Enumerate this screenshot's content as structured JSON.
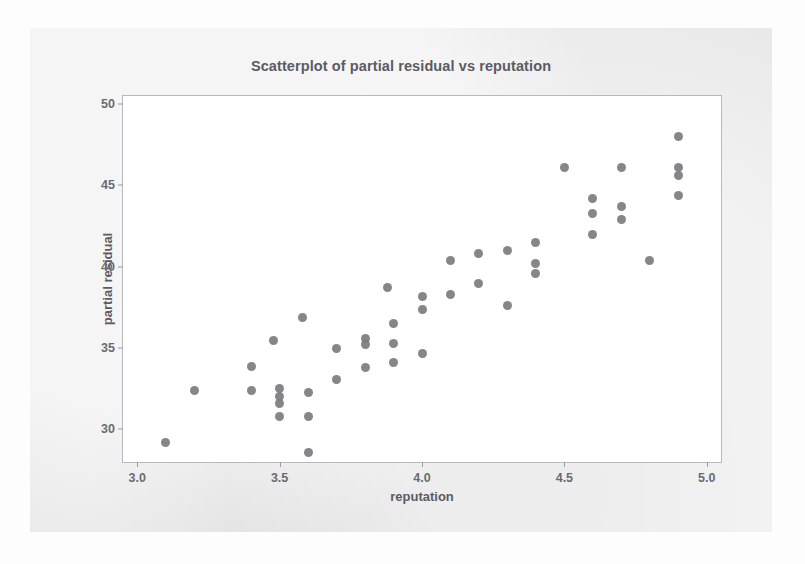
{
  "figure": {
    "background_color": "#e9e9e9",
    "plot_background_color": "#ffffff",
    "frame_color": "#b9b9bd",
    "point_color": "#7b7b80",
    "text_color": "#5b5b63"
  },
  "chart_data": {
    "type": "scatter",
    "title": "Scatterplot of partial residual vs reputation",
    "xlabel": "reputation",
    "ylabel": "partial residual",
    "xlim": [
      2.95,
      5.05
    ],
    "ylim": [
      28.0,
      50.5
    ],
    "xticks": [
      "3.0",
      "3.5",
      "4.0",
      "4.5",
      "5.0"
    ],
    "xtick_values": [
      3.0,
      3.5,
      4.0,
      4.5,
      5.0
    ],
    "yticks": [
      "30",
      "35",
      "40",
      "45",
      "50"
    ],
    "ytick_values": [
      30,
      35,
      40,
      45,
      50
    ],
    "grid": false,
    "legend": "none",
    "marker": "filled-circle",
    "points": [
      {
        "x": 3.1,
        "y": 29.2
      },
      {
        "x": 3.2,
        "y": 32.4
      },
      {
        "x": 3.4,
        "y": 33.9
      },
      {
        "x": 3.4,
        "y": 32.4
      },
      {
        "x": 3.48,
        "y": 35.5
      },
      {
        "x": 3.5,
        "y": 32.5
      },
      {
        "x": 3.5,
        "y": 32.0
      },
      {
        "x": 3.5,
        "y": 31.6
      },
      {
        "x": 3.5,
        "y": 30.8
      },
      {
        "x": 3.58,
        "y": 36.9
      },
      {
        "x": 3.6,
        "y": 32.3
      },
      {
        "x": 3.6,
        "y": 30.8
      },
      {
        "x": 3.6,
        "y": 28.6
      },
      {
        "x": 3.7,
        "y": 35.0
      },
      {
        "x": 3.7,
        "y": 33.1
      },
      {
        "x": 3.8,
        "y": 35.6
      },
      {
        "x": 3.8,
        "y": 35.2
      },
      {
        "x": 3.8,
        "y": 33.8
      },
      {
        "x": 3.88,
        "y": 38.7
      },
      {
        "x": 3.9,
        "y": 36.5
      },
      {
        "x": 3.9,
        "y": 35.3
      },
      {
        "x": 3.9,
        "y": 34.1
      },
      {
        "x": 4.0,
        "y": 38.2
      },
      {
        "x": 4.0,
        "y": 37.4
      },
      {
        "x": 4.0,
        "y": 34.7
      },
      {
        "x": 4.1,
        "y": 40.4
      },
      {
        "x": 4.1,
        "y": 38.3
      },
      {
        "x": 4.2,
        "y": 40.8
      },
      {
        "x": 4.2,
        "y": 39.0
      },
      {
        "x": 4.3,
        "y": 41.0
      },
      {
        "x": 4.3,
        "y": 37.6
      },
      {
        "x": 4.4,
        "y": 41.5
      },
      {
        "x": 4.4,
        "y": 40.2
      },
      {
        "x": 4.4,
        "y": 39.6
      },
      {
        "x": 4.5,
        "y": 46.1
      },
      {
        "x": 4.6,
        "y": 44.2
      },
      {
        "x": 4.6,
        "y": 43.3
      },
      {
        "x": 4.6,
        "y": 42.0
      },
      {
        "x": 4.7,
        "y": 46.1
      },
      {
        "x": 4.7,
        "y": 43.7
      },
      {
        "x": 4.7,
        "y": 42.9
      },
      {
        "x": 4.8,
        "y": 40.4
      },
      {
        "x": 4.9,
        "y": 48.0
      },
      {
        "x": 4.9,
        "y": 46.1
      },
      {
        "x": 4.9,
        "y": 45.6
      },
      {
        "x": 4.9,
        "y": 44.4
      }
    ]
  }
}
